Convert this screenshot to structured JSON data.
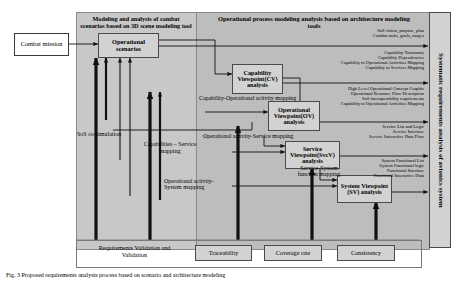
{
  "figure": {
    "caption": "Fig. 3 Proposed requirements analysis process based on scenario and architecture modeling"
  },
  "panels": {
    "left_tool": {
      "title": "Modeling and analysis of combat scenarios based on 3D scene modeling tool"
    },
    "right_tool": {
      "title": "Operational process modeling analysis based on architecture modeling tools"
    },
    "vertical": {
      "title": "Systematic requirements analysis of avionics system"
    }
  },
  "nodes": {
    "combat_mission": "Combat mission",
    "operational_scenarios": "Operational scenarios",
    "capability_viewpoint": "Capability Viewpoint(CV) analysis",
    "operational_viewpoint": "Operational Viewpoint(OV) analysis",
    "service_viewpoint": "Service Viewpoint(SvcV) analysis",
    "system_viewpoint": "System Viewpoint (SV) analysis"
  },
  "edge_labels": {
    "sos_cosimulation": "SoS co-simulation",
    "capability_operational_activity": "Capability-Operational activity mapping",
    "capabilities_service": "Capabilities – Service mapping",
    "operational_activity_service": "Operational activity-Service mapping",
    "service_system_function": "Service-System function mapping",
    "operational_activity_system": "Operational activity-System mapping"
  },
  "outputs": {
    "group1": [
      "SoS vision, purpose, plan",
      "Combat tasks, goals, ranges"
    ],
    "group2": [
      "Capability Taxonomy",
      "Capability Dependencies",
      "Capability to Operational Activities Mapping",
      "Capability to Services Mapping"
    ],
    "group3": [
      "High Level Operational Concept Graphic",
      "Operational Resource Flow Description",
      "SoS interoperability requirements",
      "Capability to Operational Activities Mapping"
    ],
    "group4": [
      "Service List and Logic",
      "Service Interface",
      "Service Interactive Data Flow"
    ],
    "group5": [
      "System Functional List",
      "System Functional logic",
      "Functional Interface",
      "Functional Interactive Data"
    ]
  },
  "bottom_row": {
    "items": [
      "Requirements Validation and Validation",
      "Traceability",
      "Coverage rate",
      "Consistency"
    ]
  },
  "colors": {
    "panel_left": "#c8c8c8",
    "panel_right": "#bdbdbd",
    "box_fill": "#d2d2d2",
    "line": "#1a1a1a"
  }
}
